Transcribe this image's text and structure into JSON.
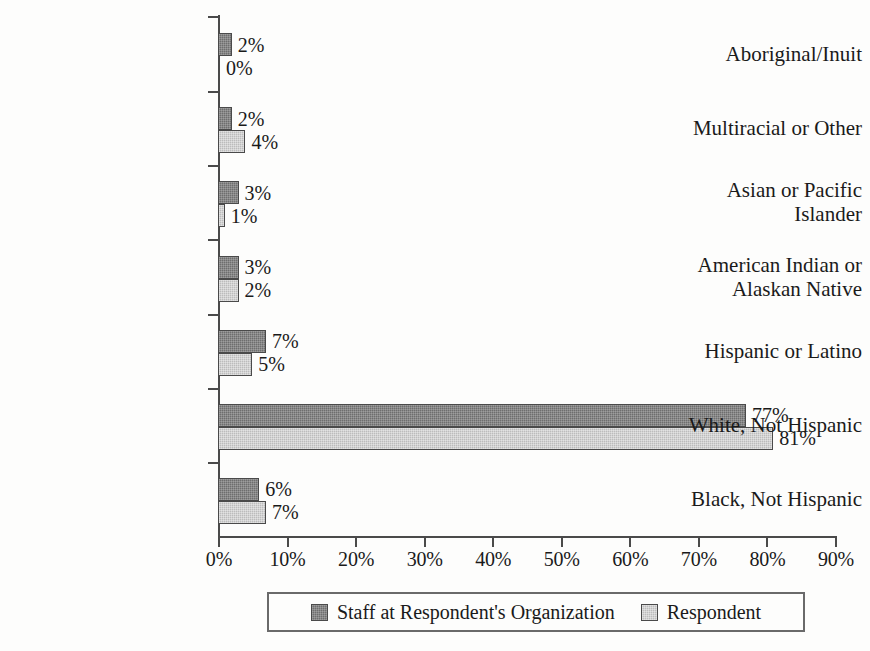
{
  "chart_data": {
    "type": "bar",
    "orientation": "horizontal",
    "title": "",
    "xlabel": "",
    "ylabel": "",
    "xlim": [
      0,
      90
    ],
    "xtick_labels": [
      "0%",
      "10%",
      "20%",
      "30%",
      "40%",
      "50%",
      "60%",
      "70%",
      "80%",
      "90%"
    ],
    "xtick_values": [
      0,
      10,
      20,
      30,
      40,
      50,
      60,
      70,
      80,
      90
    ],
    "grid": false,
    "legend_position": "bottom",
    "categories": [
      "Aboriginal/Inuit",
      "Multiracial or Other",
      "Asian or Pacific Islander",
      "American Indian or Alaskan Native",
      "Hispanic or Latino",
      "White, Not Hispanic",
      "Black, Not Hispanic"
    ],
    "category_lines": [
      [
        "Aboriginal/Inuit"
      ],
      [
        "Multiracial or Other"
      ],
      [
        "Asian or Pacific",
        "Islander"
      ],
      [
        "American Indian or",
        "Alaskan Native"
      ],
      [
        "Hispanic or Latino"
      ],
      [
        "White, Not Hispanic"
      ],
      [
        "Black, Not Hispanic"
      ]
    ],
    "series": [
      {
        "name": "Staff at Respondent's Organization",
        "color": "#6e6e6e",
        "values": [
          2,
          2,
          3,
          3,
          7,
          77,
          6
        ],
        "labels": [
          "2%",
          "2%",
          "3%",
          "3%",
          "7%",
          "77%",
          "6%"
        ]
      },
      {
        "name": "Respondent",
        "color": "#bcbcbc",
        "values": [
          0,
          4,
          1,
          3,
          5,
          81,
          7
        ],
        "labels": [
          "0%",
          "4%",
          "1%",
          "2%",
          "5%",
          "81%",
          "7%"
        ]
      }
    ]
  },
  "legend": {
    "items": [
      {
        "label": "Staff at Respondent's Organization",
        "swatch": "#6e6e6e"
      },
      {
        "label": "Respondent",
        "swatch": "#bcbcbc"
      }
    ]
  }
}
